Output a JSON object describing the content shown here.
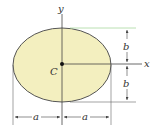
{
  "figure": {
    "shape": "ellipse",
    "fill_color": "#f3efbf",
    "outline_color": "#555555",
    "line_color": "#444444",
    "accent_line_color": "#a8d8a0",
    "labels": {
      "y_axis": "y",
      "x_axis": "x",
      "centroid": "C",
      "semi_axis_vertical_top": "b",
      "semi_axis_vertical_bottom": "b",
      "semi_axis_horizontal_left": "a",
      "semi_axis_horizontal_right": "a"
    }
  }
}
